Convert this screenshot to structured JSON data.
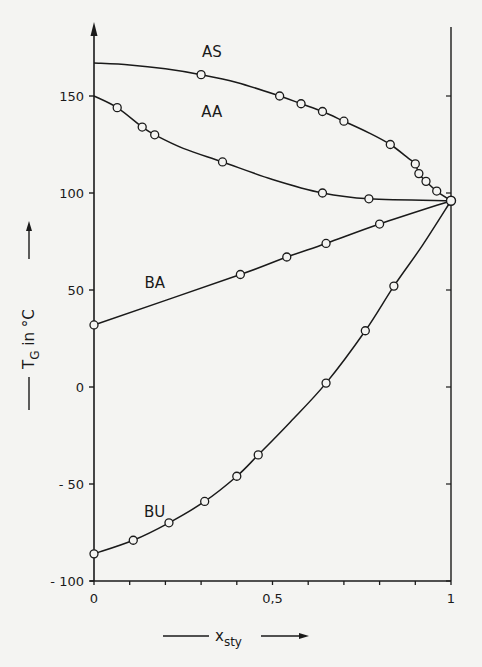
{
  "chart_data": {
    "type": "line",
    "title": "",
    "xlabel": "x_sty",
    "xlabel_main": "x",
    "xlabel_sub": "sty",
    "ylabel": "T_G in °C",
    "ylabel_main": "T",
    "ylabel_sub": "G",
    "ylabel_rest": " in °C",
    "xlim": [
      0,
      1
    ],
    "ylim": [
      -100,
      175
    ],
    "x_ticks": [
      0,
      0.1,
      0.2,
      0.3,
      0.4,
      0.5,
      0.6,
      0.7,
      0.8,
      0.9,
      1
    ],
    "x_tick_labels": [
      {
        "value": 0,
        "label": "0"
      },
      {
        "value": 0.5,
        "label": "0,5"
      },
      {
        "value": 1,
        "label": "1"
      }
    ],
    "y_ticks": [
      -100,
      -50,
      0,
      50,
      100,
      150
    ],
    "y_tick_labels": [
      "- 100",
      "- 50",
      "0",
      "50",
      "100",
      "150"
    ],
    "grid": false,
    "legend": "inline labels",
    "marker": "open-circle",
    "series": [
      {
        "name": "AS",
        "label_pos": [
          0.33,
          170
        ],
        "curve": [
          [
            0,
            167
          ],
          [
            0.1,
            166
          ],
          [
            0.2,
            164
          ],
          [
            0.3,
            161
          ],
          [
            0.4,
            157
          ],
          [
            0.52,
            150
          ],
          [
            0.58,
            146
          ],
          [
            0.64,
            142
          ],
          [
            0.7,
            137
          ],
          [
            0.77,
            131
          ],
          [
            0.83,
            125
          ],
          [
            0.88,
            118
          ],
          [
            0.9,
            115
          ],
          [
            0.91,
            110
          ],
          [
            0.93,
            106
          ],
          [
            0.96,
            101
          ],
          [
            1,
            96
          ]
        ],
        "points": [
          [
            0.3,
            161
          ],
          [
            0.52,
            150
          ],
          [
            0.58,
            146
          ],
          [
            0.64,
            142
          ],
          [
            0.7,
            137
          ],
          [
            0.83,
            125
          ],
          [
            0.9,
            115
          ],
          [
            0.91,
            110
          ],
          [
            0.93,
            106
          ],
          [
            0.96,
            101
          ],
          [
            1,
            96
          ]
        ]
      },
      {
        "name": "AA",
        "label_pos": [
          0.33,
          139
        ],
        "curve": [
          [
            0,
            150
          ],
          [
            0.065,
            144
          ],
          [
            0.135,
            134
          ],
          [
            0.17,
            130
          ],
          [
            0.25,
            123
          ],
          [
            0.36,
            116
          ],
          [
            0.5,
            107
          ],
          [
            0.64,
            100
          ],
          [
            0.77,
            97
          ],
          [
            1,
            96
          ]
        ],
        "points": [
          [
            0.065,
            144
          ],
          [
            0.135,
            134
          ],
          [
            0.17,
            130
          ],
          [
            0.36,
            116
          ],
          [
            0.64,
            100
          ],
          [
            0.77,
            97
          ]
        ]
      },
      {
        "name": "BA",
        "label_pos": [
          0.17,
          51
        ],
        "curve": [
          [
            0,
            32
          ],
          [
            0.41,
            58
          ],
          [
            0.54,
            67
          ],
          [
            0.65,
            74
          ],
          [
            0.8,
            84
          ],
          [
            1,
            96
          ]
        ],
        "points": [
          [
            0,
            32
          ],
          [
            0.41,
            58
          ],
          [
            0.54,
            67
          ],
          [
            0.65,
            74
          ],
          [
            0.8,
            84
          ]
        ]
      },
      {
        "name": "BU",
        "label_pos": [
          0.17,
          -67
        ],
        "curve": [
          [
            0,
            -86
          ],
          [
            0.11,
            -79
          ],
          [
            0.21,
            -70
          ],
          [
            0.31,
            -59
          ],
          [
            0.4,
            -46
          ],
          [
            0.46,
            -35
          ],
          [
            0.55,
            -18
          ],
          [
            0.65,
            2
          ],
          [
            0.76,
            29
          ],
          [
            0.84,
            52
          ],
          [
            0.92,
            73
          ],
          [
            1,
            96
          ]
        ],
        "points": [
          [
            0,
            -86
          ],
          [
            0.11,
            -79
          ],
          [
            0.21,
            -70
          ],
          [
            0.31,
            -59
          ],
          [
            0.4,
            -46
          ],
          [
            0.46,
            -35
          ],
          [
            0.65,
            2
          ],
          [
            0.76,
            29
          ],
          [
            0.84,
            52
          ]
        ]
      }
    ],
    "common_endpoint": [
      1,
      96
    ]
  }
}
